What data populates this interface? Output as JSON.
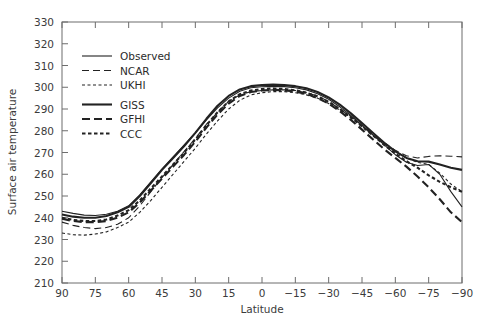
{
  "chart_data": {
    "type": "line",
    "title": "",
    "xlabel": "Latitude",
    "ylabel": "Surface air temperature",
    "xlim": [
      90,
      -90
    ],
    "ylim": [
      210,
      330
    ],
    "grid": false,
    "legend_position": "upper-left",
    "xticks": [
      "90",
      "75",
      "60",
      "45",
      "30",
      "15",
      "0",
      "-15",
      "-30",
      "-45",
      "-60",
      "-75",
      "-90"
    ],
    "xtick_values": [
      90,
      75,
      60,
      45,
      30,
      15,
      0,
      -15,
      -30,
      -45,
      -60,
      -75,
      -90
    ],
    "yticks": [
      "210",
      "220",
      "230",
      "240",
      "250",
      "260",
      "270",
      "280",
      "290",
      "300",
      "310",
      "320",
      "330"
    ],
    "ytick_values": [
      210,
      220,
      230,
      240,
      250,
      260,
      270,
      280,
      290,
      300,
      310,
      320,
      330
    ],
    "x": [
      90,
      85,
      80,
      75,
      70,
      65,
      60,
      55,
      50,
      45,
      40,
      35,
      30,
      25,
      20,
      15,
      10,
      5,
      0,
      -5,
      -10,
      -15,
      -20,
      -25,
      -30,
      -35,
      -40,
      -45,
      -50,
      -55,
      -60,
      -65,
      -70,
      -75,
      -80,
      -85,
      -90
    ],
    "series": [
      {
        "name": "Observed",
        "style": "solid",
        "width": 1.1,
        "values": [
          243.0,
          242.0,
          241.2,
          241.0,
          241.6,
          243.0,
          245.5,
          250.5,
          256.5,
          262.5,
          268.0,
          273.5,
          279.0,
          285.0,
          290.5,
          295.0,
          298.2,
          299.8,
          300.2,
          300.4,
          300.3,
          299.8,
          298.8,
          297.0,
          294.5,
          291.0,
          287.0,
          282.5,
          278.0,
          273.5,
          269.0,
          265.5,
          264.0,
          264.5,
          260.0,
          252.0,
          245.0
        ]
      },
      {
        "name": "NCAR",
        "style": "dashed",
        "width": 1.1,
        "values": [
          238.0,
          236.5,
          235.5,
          235.0,
          235.5,
          237.0,
          240.0,
          245.5,
          252.0,
          258.5,
          264.5,
          270.5,
          276.5,
          283.0,
          288.5,
          293.5,
          296.5,
          298.0,
          298.5,
          298.8,
          298.8,
          298.5,
          297.5,
          296.0,
          293.5,
          290.0,
          286.5,
          282.5,
          278.5,
          274.5,
          271.0,
          268.5,
          267.5,
          268.2,
          268.5,
          268.3,
          268.0
        ]
      },
      {
        "name": "UKHI",
        "style": "dotted",
        "width": 1.1,
        "values": [
          233.0,
          232.2,
          232.0,
          232.5,
          233.5,
          235.5,
          238.0,
          242.5,
          248.0,
          254.0,
          260.0,
          266.0,
          272.0,
          278.5,
          284.5,
          290.0,
          294.0,
          296.5,
          297.5,
          298.0,
          298.0,
          297.5,
          296.5,
          295.0,
          292.5,
          289.5,
          286.0,
          282.0,
          278.0,
          274.0,
          270.5,
          267.5,
          265.5,
          264.5,
          260.5,
          255.5,
          252.0
        ]
      },
      {
        "name": "GISS",
        "style": "solid",
        "width": 2.1,
        "values": [
          241.5,
          240.5,
          240.0,
          240.0,
          240.8,
          242.5,
          245.0,
          250.0,
          256.0,
          262.0,
          267.5,
          273.0,
          279.0,
          285.5,
          291.5,
          296.0,
          299.0,
          300.5,
          301.0,
          301.2,
          301.0,
          300.5,
          299.5,
          297.8,
          295.3,
          292.0,
          288.0,
          283.5,
          279.0,
          274.5,
          270.5,
          267.5,
          266.0,
          265.8,
          264.5,
          263.0,
          262.0
        ]
      },
      {
        "name": "GFHI",
        "style": "dashed",
        "width": 2.1,
        "values": [
          239.5,
          238.5,
          238.0,
          238.0,
          238.5,
          240.0,
          242.5,
          247.0,
          252.5,
          258.0,
          263.5,
          269.0,
          275.0,
          281.5,
          287.5,
          292.5,
          296.0,
          297.8,
          298.5,
          298.8,
          298.6,
          298.0,
          297.0,
          295.0,
          292.5,
          289.0,
          285.0,
          280.5,
          276.0,
          271.5,
          267.5,
          263.5,
          259.0,
          254.0,
          248.5,
          242.5,
          238.0
        ]
      },
      {
        "name": "CCC",
        "style": "dotted",
        "width": 2.1,
        "values": [
          240.0,
          239.0,
          238.5,
          238.5,
          239.2,
          241.0,
          243.5,
          248.0,
          253.5,
          259.0,
          264.5,
          270.0,
          276.0,
          282.5,
          288.5,
          293.5,
          296.8,
          298.5,
          299.2,
          299.4,
          299.2,
          298.6,
          297.5,
          295.8,
          293.3,
          290.0,
          286.2,
          282.0,
          277.8,
          273.5,
          269.5,
          266.0,
          263.0,
          259.5,
          256.5,
          254.0,
          252.0
        ]
      }
    ]
  },
  "legend": {
    "items": [
      {
        "label": "Observed"
      },
      {
        "label": "NCAR"
      },
      {
        "label": "UKHI"
      },
      {
        "label": "GISS"
      },
      {
        "label": "GFHI"
      },
      {
        "label": "CCC"
      }
    ]
  },
  "colors": {
    "curve": "#222222",
    "axis": "#6d6d6d",
    "text": "#3b3b3b"
  }
}
